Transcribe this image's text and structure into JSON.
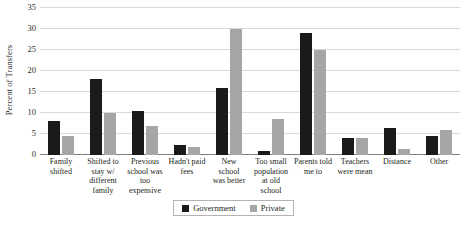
{
  "chart_data": {
    "type": "bar",
    "title": "",
    "xlabel": "",
    "ylabel": "Percent of Transfers",
    "ylim": [
      0,
      35
    ],
    "yticks": [
      0,
      5,
      10,
      15,
      20,
      25,
      30,
      35
    ],
    "grid": true,
    "legend_position": "bottom-center",
    "categories": [
      "Family shifted",
      "Shifted to stay w/ different family",
      "Previous school was too expensive",
      "Hadn't paid fees",
      "New school was better",
      "Too small population at old school",
      "Parents told me to",
      "Teachers were mean",
      "Distance",
      "Other"
    ],
    "category_lines": [
      [
        "Family",
        "shifted"
      ],
      [
        "Shifted to",
        "stay w/",
        "different",
        "family"
      ],
      [
        "Previous",
        "school was",
        "too",
        "expensive"
      ],
      [
        "Hadn't paid",
        "fees"
      ],
      [
        "New",
        "school",
        "was better"
      ],
      [
        "Too small",
        "population",
        "at old",
        "school"
      ],
      [
        "Parents told",
        "me to"
      ],
      [
        "Teachers",
        "were mean"
      ],
      [
        "Distance"
      ],
      [
        "Other"
      ]
    ],
    "series": [
      {
        "name": "Government",
        "color": "#1a1a1a",
        "values": [
          8,
          18,
          10.5,
          2.5,
          16,
          1,
          29,
          4,
          6.5,
          4.5
        ]
      },
      {
        "name": "Private",
        "color": "#a6a6a6",
        "values": [
          4.5,
          10,
          7,
          2,
          30,
          8.5,
          25,
          4,
          1.5,
          6
        ]
      }
    ]
  },
  "legend": {
    "items": [
      {
        "label": "Government",
        "swatch": "gov"
      },
      {
        "label": "Private",
        "swatch": "priv"
      }
    ]
  }
}
